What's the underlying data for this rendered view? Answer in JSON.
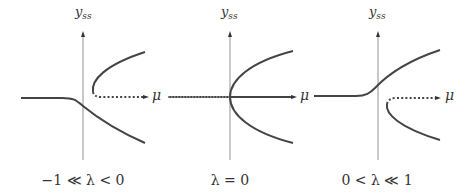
{
  "panels": [
    {
      "id": "panel-1",
      "y_label_main": "y",
      "y_label_sub": "ss",
      "x_label": "μ",
      "caption": "−1 ≪ λ < 0"
    },
    {
      "id": "panel-2",
      "y_label_main": "y",
      "y_label_sub": "ss",
      "x_label": "μ",
      "caption": "λ = 0"
    },
    {
      "id": "panel-3",
      "y_label_main": "y",
      "y_label_sub": "ss",
      "x_label": "μ",
      "caption": "0 < λ ≪ 1"
    }
  ],
  "colors": {
    "axis": "#555555",
    "curve": "#444444",
    "text": "#333333"
  }
}
